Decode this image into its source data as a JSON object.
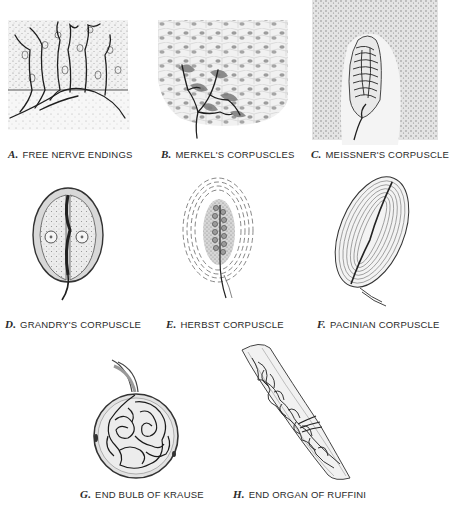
{
  "figure": {
    "panels": [
      {
        "letter": "A.",
        "label": "FREE NERVE ENDINGS"
      },
      {
        "letter": "B.",
        "label": "MERKEL'S CORPUSCLES"
      },
      {
        "letter": "C.",
        "label": "MEISSNER'S CORPUSCLE"
      },
      {
        "letter": "D.",
        "label": "GRANDRY'S CORPUSCLE"
      },
      {
        "letter": "E.",
        "label": "HERBST CORPUSCLE"
      },
      {
        "letter": "F.",
        "label": "PACINIAN CORPUSCLE"
      },
      {
        "letter": "G.",
        "label": "END BULB OF KRAUSE"
      },
      {
        "letter": "H.",
        "label": "END ORGAN OF RUFFINI"
      }
    ]
  },
  "colors": {
    "ink": "#1e1e1e",
    "stipple": "#9a9a9a",
    "fill": "#e6e6e6",
    "background": "#ffffff"
  }
}
